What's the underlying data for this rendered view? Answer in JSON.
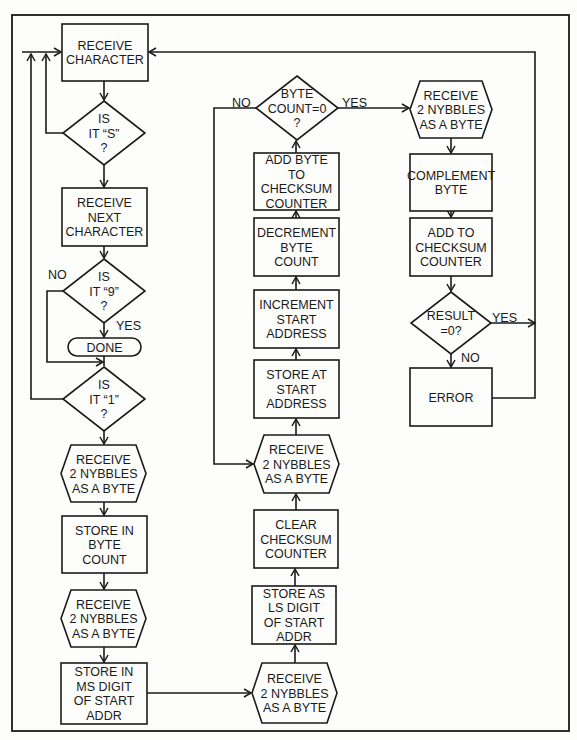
{
  "figure": {
    "colors": {
      "ink": "#1a1a1a",
      "paper": "#fdfdfb"
    }
  },
  "nodes": [
    {
      "id": "receive-character",
      "shape": "rect",
      "x": 62,
      "y": 24,
      "w": 86,
      "h": 57,
      "lines": [
        "RECEIVE",
        "CHARACTER"
      ]
    },
    {
      "id": "is-it-s",
      "shape": "diamond",
      "cx": 104,
      "cy": 133,
      "hw": 41,
      "hh": 32,
      "lines": [
        "IS",
        "IT “S”",
        "?"
      ]
    },
    {
      "id": "receive-next-character",
      "shape": "rect",
      "x": 62,
      "y": 188,
      "w": 85,
      "h": 58,
      "lines": [
        "RECEIVE",
        "NEXT",
        "CHARACTER"
      ]
    },
    {
      "id": "is-it-9",
      "shape": "diamond",
      "cx": 104,
      "cy": 291,
      "hw": 41,
      "hh": 32,
      "lines": [
        "IS",
        "IT “9”",
        "?"
      ]
    },
    {
      "id": "done",
      "shape": "terminal",
      "x": 68,
      "y": 338,
      "w": 73,
      "h": 18,
      "lines": [
        "DONE"
      ]
    },
    {
      "id": "is-it-1",
      "shape": "diamond",
      "cx": 104,
      "cy": 399,
      "hw": 41,
      "hh": 32,
      "lines": [
        "IS",
        "IT “1”",
        "?"
      ]
    },
    {
      "id": "receive-nybbles-1",
      "shape": "hex",
      "x": 61,
      "y": 445,
      "w": 85,
      "h": 57,
      "lines": [
        "RECEIVE",
        "2 NYBBLES",
        "AS A BYTE"
      ]
    },
    {
      "id": "store-byte-count",
      "shape": "rect",
      "x": 62,
      "y": 516,
      "w": 85,
      "h": 57,
      "lines": [
        "STORE IN",
        "BYTE",
        "COUNT"
      ]
    },
    {
      "id": "receive-nybbles-2",
      "shape": "hex",
      "x": 61,
      "y": 590,
      "w": 85,
      "h": 57,
      "lines": [
        "RECEIVE",
        "2 NYBBLES",
        "AS A BYTE"
      ]
    },
    {
      "id": "store-ms-digit",
      "shape": "rect",
      "x": 61,
      "y": 663,
      "w": 86,
      "h": 61,
      "lines": [
        "STORE IN",
        "MS DIGIT",
        "OF START",
        "ADDR"
      ]
    },
    {
      "id": "receive-nybbles-3",
      "shape": "hex",
      "x": 252,
      "y": 663,
      "w": 85,
      "h": 60,
      "lines": [
        "RECEIVE",
        "2 NYBBLES",
        "AS A BYTE"
      ]
    },
    {
      "id": "store-ls-digit",
      "shape": "rect",
      "x": 252,
      "y": 586,
      "w": 84,
      "h": 58,
      "lines": [
        "STORE AS",
        "LS DIGIT",
        "OF START",
        "ADDR"
      ]
    },
    {
      "id": "clear-checksum",
      "shape": "rect",
      "x": 254,
      "y": 510,
      "w": 84,
      "h": 58,
      "lines": [
        "CLEAR",
        "CHECKSUM",
        "COUNTER"
      ]
    },
    {
      "id": "receive-nybbles-4",
      "shape": "hex",
      "x": 254,
      "y": 435,
      "w": 85,
      "h": 58,
      "lines": [
        "RECEIVE",
        "2 NYBBLES",
        "AS A BYTE"
      ]
    },
    {
      "id": "store-at-start-address",
      "shape": "rect",
      "x": 254,
      "y": 360,
      "w": 85,
      "h": 58,
      "lines": [
        "STORE AT",
        "START",
        "ADDRESS"
      ]
    },
    {
      "id": "increment-start-address",
      "shape": "rect",
      "x": 254,
      "y": 290,
      "w": 85,
      "h": 58,
      "lines": [
        "INCREMENT",
        "START",
        "ADDRESS"
      ]
    },
    {
      "id": "decrement-byte-count",
      "shape": "rect",
      "x": 254,
      "y": 218,
      "w": 85,
      "h": 58,
      "lines": [
        "DECREMENT",
        "BYTE",
        "COUNT"
      ]
    },
    {
      "id": "add-byte-to-checksum",
      "shape": "rect",
      "x": 254,
      "y": 153,
      "w": 85,
      "h": 57,
      "lines": [
        "ADD BYTE",
        "TO",
        "CHECKSUM",
        "COUNTER"
      ]
    },
    {
      "id": "byte-count-zero",
      "shape": "diamond",
      "cx": 297,
      "cy": 108,
      "hw": 41,
      "hh": 32,
      "lines": [
        "BYTE",
        "COUNT=0",
        "?"
      ]
    },
    {
      "id": "receive-nybbles-5",
      "shape": "hex",
      "x": 410,
      "y": 81,
      "w": 82,
      "h": 57,
      "lines": [
        "RECEIVE",
        "2 NYBBLES",
        "AS A BYTE"
      ]
    },
    {
      "id": "complement-byte",
      "shape": "rect",
      "x": 410,
      "y": 154,
      "w": 82,
      "h": 57,
      "lines": [
        "COMPLEMENT",
        "BYTE"
      ]
    },
    {
      "id": "add-to-checksum",
      "shape": "rect",
      "x": 410,
      "y": 218,
      "w": 82,
      "h": 58,
      "lines": [
        "ADD TO",
        "CHECKSUM",
        "COUNTER"
      ]
    },
    {
      "id": "result-zero",
      "shape": "diamond",
      "cx": 451,
      "cy": 323,
      "hw": 40,
      "hh": 31,
      "lines": [
        "RESULT",
        "=0?"
      ]
    },
    {
      "id": "error",
      "shape": "rect",
      "x": 410,
      "y": 368,
      "w": 82,
      "h": 58,
      "lines": [
        "ERROR"
      ]
    }
  ],
  "labels": [
    {
      "id": "label-no-9",
      "text": "NO",
      "x": 48,
      "y": 279
    },
    {
      "id": "label-yes-9",
      "text": "YES",
      "x": 116,
      "y": 330
    },
    {
      "id": "label-no-bytecount",
      "text": "NO",
      "x": 232,
      "y": 107
    },
    {
      "id": "label-yes-bytecount",
      "text": "YES",
      "x": 342,
      "y": 107
    },
    {
      "id": "label-yes-result",
      "text": "YES",
      "x": 492,
      "y": 322
    },
    {
      "id": "label-no-result",
      "text": "NO",
      "x": 461,
      "y": 362
    }
  ]
}
